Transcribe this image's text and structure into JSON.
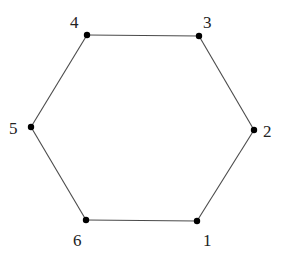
{
  "diagram": {
    "type": "hexagon-graph",
    "vertices": [
      {
        "id": "1",
        "label": "1",
        "x": 197,
        "y": 221,
        "label_x": 203,
        "label_y": 246
      },
      {
        "id": "2",
        "label": "2",
        "x": 254,
        "y": 130,
        "label_x": 263,
        "label_y": 137
      },
      {
        "id": "3",
        "label": "3",
        "x": 199,
        "y": 36,
        "label_x": 203,
        "label_y": 28
      },
      {
        "id": "4",
        "label": "4",
        "x": 87,
        "y": 35,
        "label_x": 70,
        "label_y": 28
      },
      {
        "id": "5",
        "label": "5",
        "x": 31,
        "y": 127,
        "label_x": 9,
        "label_y": 134
      },
      {
        "id": "6",
        "label": "6",
        "x": 86,
        "y": 220,
        "label_x": 73,
        "label_y": 246
      }
    ],
    "edges": [
      [
        "1",
        "2"
      ],
      [
        "2",
        "3"
      ],
      [
        "3",
        "4"
      ],
      [
        "4",
        "5"
      ],
      [
        "5",
        "6"
      ],
      [
        "6",
        "1"
      ]
    ],
    "colors": {
      "edge": "#4a4a4a",
      "vertex": "#000000",
      "label": "#222222"
    }
  }
}
